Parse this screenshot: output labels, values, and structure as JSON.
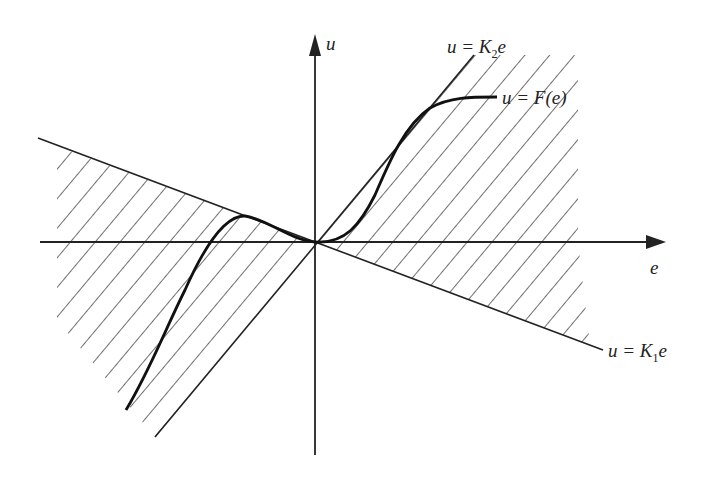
{
  "diagram": {
    "title": "",
    "axes": {
      "x_label": "e",
      "y_label": "u"
    },
    "lines": [
      {
        "name": "upper-sector-bound",
        "equation_prefix": "u = K",
        "subscript": "2",
        "suffix": "e"
      },
      {
        "name": "lower-sector-bound",
        "equation_prefix": "u = K",
        "subscript": "1",
        "suffix": "e"
      }
    ],
    "curve": {
      "label": "u = F(e)"
    },
    "colors": {
      "ink": "#222222",
      "background": "#ffffff"
    }
  }
}
